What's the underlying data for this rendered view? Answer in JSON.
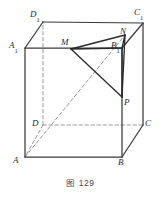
{
  "figure": {
    "caption": "图 129",
    "caption_prefix": "图",
    "caption_number": "129",
    "type": "geometry-cube-diagram",
    "background_color": "#ffffff",
    "solid_line_color": "#3a3a3a",
    "dashed_line_color": "#9a9a9a",
    "label_color": "#2b2b2b",
    "width": 161,
    "height": 202
  },
  "labels": {
    "A1": "A",
    "A1_sub": "1",
    "B1": "B",
    "B1_sub": "1",
    "C1": "C",
    "C1_sub": "1",
    "D1": "D",
    "D1_sub": "1",
    "A": "A",
    "B": "B",
    "C": "C",
    "D": "D",
    "M": "M",
    "N": "N",
    "P": "P"
  },
  "geometry": {
    "vertices": {
      "A1": {
        "x": 25,
        "y": 48
      },
      "B1": {
        "x": 122,
        "y": 48
      },
      "C1": {
        "x": 143,
        "y": 23
      },
      "D1": {
        "x": 43,
        "y": 22
      },
      "A": {
        "x": 25,
        "y": 157
      },
      "B": {
        "x": 122,
        "y": 157
      },
      "C": {
        "x": 143,
        "y": 125
      },
      "D": {
        "x": 43,
        "y": 125
      }
    },
    "points": {
      "M": {
        "x": 71,
        "y": 49,
        "on_edge": "A1B1"
      },
      "N": {
        "x": 125,
        "y": 35,
        "on_edge": "B1C1"
      },
      "P": {
        "x": 122,
        "y": 97,
        "on_edge": "BB1"
      }
    },
    "solid_edges": [
      "A1-B1",
      "B1-C1",
      "C1-D1",
      "D1-A1",
      "A-B",
      "B-C",
      "A-A1",
      "B-B1",
      "C-C1"
    ],
    "dashed_edges": [
      "D-A",
      "D-C",
      "D-D1"
    ],
    "construction_solid": [
      "M-N",
      "M-P",
      "N-P",
      "B1-N",
      "B1-M",
      "B1-P"
    ],
    "construction_dashed": [
      "A-N"
    ]
  }
}
